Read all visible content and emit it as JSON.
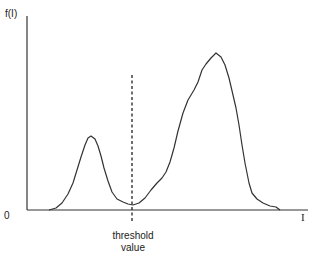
{
  "chart_data": {
    "type": "line",
    "title": "",
    "xlabel": "I",
    "ylabel": "f(I)",
    "origin_label": "0",
    "annotations": [
      {
        "text": "threshold value",
        "x_px": 132,
        "style": "dashed vertical line"
      }
    ],
    "series": [
      {
        "name": "f(I)",
        "points_px": [
          [
            49,
            210
          ],
          [
            56,
            208
          ],
          [
            62,
            203
          ],
          [
            68,
            194
          ],
          [
            73,
            183
          ],
          [
            77,
            170
          ],
          [
            81,
            157
          ],
          [
            85,
            145
          ],
          [
            88,
            138
          ],
          [
            91,
            136
          ],
          [
            95,
            139
          ],
          [
            98,
            146
          ],
          [
            101,
            156
          ],
          [
            104,
            168
          ],
          [
            108,
            181
          ],
          [
            112,
            192
          ],
          [
            117,
            199
          ],
          [
            123,
            202
          ],
          [
            128,
            204
          ],
          [
            133,
            205
          ],
          [
            139,
            203
          ],
          [
            145,
            198
          ],
          [
            151,
            190
          ],
          [
            157,
            183
          ],
          [
            162,
            178
          ],
          [
            166,
            172
          ],
          [
            170,
            162
          ],
          [
            174,
            148
          ],
          [
            178,
            131
          ],
          [
            183,
            113
          ],
          [
            188,
            100
          ],
          [
            194,
            90
          ],
          [
            198,
            82
          ],
          [
            202,
            70
          ],
          [
            206,
            64
          ],
          [
            211,
            58
          ],
          [
            216,
            53
          ],
          [
            221,
            57
          ],
          [
            225,
            65
          ],
          [
            229,
            78
          ],
          [
            233,
            95
          ],
          [
            236,
            108
          ],
          [
            239,
            125
          ],
          [
            242,
            145
          ],
          [
            245,
            163
          ],
          [
            249,
            183
          ],
          [
            252,
            193
          ],
          [
            257,
            199
          ],
          [
            263,
            203
          ],
          [
            270,
            206
          ],
          [
            276,
            207
          ],
          [
            280,
            210
          ]
        ]
      }
    ],
    "grid": false,
    "legend": null
  },
  "labels": {
    "y_axis": "f(I)",
    "x_axis": "I",
    "origin": "0",
    "threshold_line1": "threshold",
    "threshold_line2": "value"
  },
  "colors": {
    "axis": "#333333",
    "curve": "#333333",
    "threshold": "#222222"
  }
}
